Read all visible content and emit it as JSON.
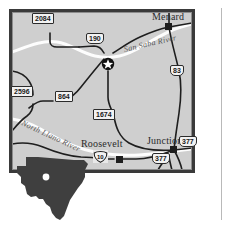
{
  "map": {
    "title": "Texas Hill Country area road map",
    "background_color": "#cfcfcf",
    "frame_color": "#3a3a3a",
    "page_background": "#ffffff",
    "road_color": "#1e1e1e",
    "river_color": "#fdfdfd",
    "cities": [
      {
        "name": "Menard",
        "marker": "square",
        "x": 152,
        "y": 17
      },
      {
        "name": "Junction",
        "marker": "square",
        "x": 147,
        "y": 141
      },
      {
        "name": "Roosevelt",
        "marker": "none",
        "x": 81,
        "y": 143
      }
    ],
    "star_marker": {
      "name": "star-city-marker",
      "x": 99,
      "y": 55
    },
    "rivers": [
      {
        "name": "San Saba River",
        "x": 124,
        "y": 49,
        "rotate": -12
      },
      {
        "name": "North Llano River",
        "x": 21,
        "y": 118,
        "rotate": 26
      }
    ],
    "route_shields": [
      {
        "number": "2084",
        "type": "state",
        "x": 41,
        "y": 17
      },
      {
        "number": "190",
        "type": "us",
        "x": 93,
        "y": 37
      },
      {
        "number": "83",
        "type": "us",
        "x": 177,
        "y": 69
      },
      {
        "number": "2596",
        "type": "state",
        "x": 19,
        "y": 90
      },
      {
        "number": "864",
        "type": "state",
        "x": 62,
        "y": 95
      },
      {
        "number": "1674",
        "type": "state",
        "x": 101,
        "y": 113
      },
      {
        "number": "377",
        "type": "us",
        "x": 186,
        "y": 140
      },
      {
        "number": "377",
        "type": "us",
        "x": 159,
        "y": 157
      },
      {
        "number": "10",
        "type": "interstate",
        "x": 99,
        "y": 155
      }
    ],
    "inset": {
      "name": "texas-state-inset",
      "fill_color": "#3f3f3f",
      "locator_dot_color": "#ffffff"
    }
  }
}
